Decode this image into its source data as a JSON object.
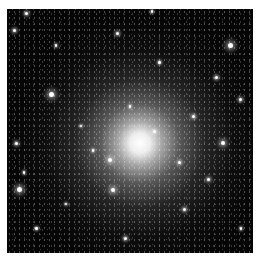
{
  "image": {
    "subject": "globular star cluster",
    "colors": {
      "background": "#050505",
      "border": "#ffffff",
      "core": "#ffffff"
    },
    "core_position_pct": [
      54,
      55
    ],
    "bright_stars": [
      {
        "x": 8,
        "y": 2,
        "r": 1.5
      },
      {
        "x": 59,
        "y": 1,
        "r": 1.2
      },
      {
        "x": 3,
        "y": 9,
        "r": 1.5
      },
      {
        "x": 4,
        "y": 55,
        "r": 1.5
      },
      {
        "x": 18,
        "y": 35,
        "r": 2.5
      },
      {
        "x": 45,
        "y": 10,
        "r": 1.5
      },
      {
        "x": 91,
        "y": 15,
        "r": 2.5
      },
      {
        "x": 85,
        "y": 28,
        "r": 1.5
      },
      {
        "x": 95,
        "y": 37,
        "r": 1.5
      },
      {
        "x": 88,
        "y": 55,
        "r": 2
      },
      {
        "x": 42,
        "y": 62,
        "r": 2
      },
      {
        "x": 5,
        "y": 74,
        "r": 2.5
      },
      {
        "x": 7,
        "y": 67,
        "r": 1.2
      },
      {
        "x": 43,
        "y": 74,
        "r": 2
      },
      {
        "x": 82,
        "y": 70,
        "r": 1.5
      },
      {
        "x": 24,
        "y": 80,
        "r": 1.2
      },
      {
        "x": 48,
        "y": 94,
        "r": 1.5
      },
      {
        "x": 70,
        "y": 63,
        "r": 1.5
      },
      {
        "x": 76,
        "y": 44,
        "r": 1.5
      },
      {
        "x": 30,
        "y": 48,
        "r": 1.2
      },
      {
        "x": 12,
        "y": 90,
        "r": 1.2
      },
      {
        "x": 95,
        "y": 90,
        "r": 1.2
      },
      {
        "x": 62,
        "y": 22,
        "r": 1.2
      },
      {
        "x": 20,
        "y": 15,
        "r": 1.2
      },
      {
        "x": 72,
        "y": 82,
        "r": 1.5
      },
      {
        "x": 35,
        "y": 58,
        "r": 1.2
      },
      {
        "x": 60,
        "y": 50,
        "r": 1.5
      },
      {
        "x": 50,
        "y": 40,
        "r": 1.2
      }
    ]
  }
}
